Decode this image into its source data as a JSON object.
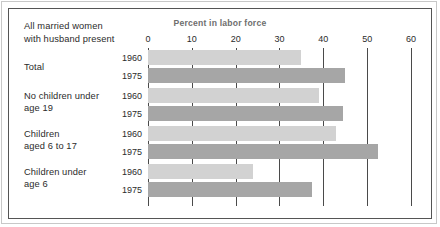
{
  "figure": {
    "stub_head_line1": "All married women",
    "stub_head_line2": "with husband present"
  },
  "chart_data": {
    "type": "bar",
    "orientation": "horizontal",
    "title": "Percent in labor force",
    "xlabel": "Percent in labor force",
    "ylabel": "",
    "xlim": [
      0,
      60
    ],
    "xticks": [
      0,
      10,
      20,
      30,
      40,
      50,
      60
    ],
    "xtick_labels": [
      "0",
      "10",
      "20",
      "30",
      "40",
      "50",
      "60"
    ],
    "grid": true,
    "legend": "none",
    "categories": [
      "Total",
      "No children under age 19",
      "Children aged 6 to 17",
      "Children under age 6"
    ],
    "category_label_lines": [
      [
        "Total"
      ],
      [
        "No children under",
        "age 19"
      ],
      [
        "Children",
        "aged 6 to 17"
      ],
      [
        "Children under",
        "age 6"
      ]
    ],
    "series": [
      {
        "name": "1960",
        "color": "#d2d2d2",
        "values": [
          35,
          39,
          43,
          24
        ]
      },
      {
        "name": "1975",
        "color": "#a6a6a6",
        "values": [
          45,
          44.5,
          52.5,
          37.5
        ]
      }
    ],
    "groups": [
      {
        "label": "Total",
        "rows": [
          {
            "year": "1960",
            "value": 35
          },
          {
            "year": "1975",
            "value": 45
          }
        ]
      },
      {
        "label": "No children under age 19",
        "rows": [
          {
            "year": "1960",
            "value": 39
          },
          {
            "year": "1975",
            "value": 44.5
          }
        ]
      },
      {
        "label": "Children aged 6 to 17",
        "rows": [
          {
            "year": "1960",
            "value": 43
          },
          {
            "year": "1975",
            "value": 52.5
          }
        ]
      },
      {
        "label": "Children under age 6",
        "rows": [
          {
            "year": "1960",
            "value": 24
          },
          {
            "year": "1975",
            "value": 37.5
          }
        ]
      }
    ]
  },
  "colors": {
    "bar_1960": "#d2d2d2",
    "bar_1975": "#a6a6a6",
    "axis": "#4a4a4a",
    "frame": "#555555",
    "title": "#6e6e6e",
    "text": "#2b2b2b"
  }
}
